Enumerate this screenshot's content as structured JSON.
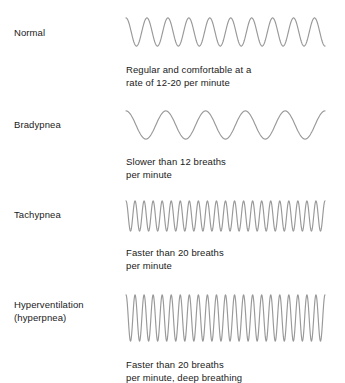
{
  "figure": {
    "background_color": "#ffffff",
    "text_color": "#1a1a1a",
    "wave_color": "#999999"
  },
  "chart_data": {
    "type": "line",
    "xlabel": "",
    "ylabel": "",
    "grid": false,
    "legend_position": "left-labels",
    "series": [
      {
        "name": "Normal",
        "cycles": 9.5,
        "amplitude_px": 30,
        "rate_description": "12-20 per minute",
        "wave_x_start_px": 126,
        "wave_x_end_px": 325,
        "wave_y_top_px": 17,
        "wave_y_bottom_px": 47
      },
      {
        "name": "Bradypnea",
        "cycles": 5,
        "amplitude_px": 30,
        "rate_description": "slower than 12 per minute",
        "wave_x_start_px": 126,
        "wave_x_end_px": 325,
        "wave_y_top_px": 110,
        "wave_y_bottom_px": 140
      },
      {
        "name": "Tachypnea",
        "cycles": 22,
        "amplitude_px": 32,
        "rate_description": "faster than 20 per minute",
        "wave_x_start_px": 126,
        "wave_x_end_px": 325,
        "wave_y_top_px": 200,
        "wave_y_bottom_px": 232
      },
      {
        "name": "Hyperventilation (hyperpnea)",
        "cycles": 22,
        "amplitude_px": 48,
        "rate_description": "faster than 20 per minute, deep breathing",
        "wave_x_start_px": 126,
        "wave_x_end_px": 325,
        "wave_y_top_px": 294,
        "wave_y_bottom_px": 342
      }
    ]
  },
  "rows": [
    {
      "label": "Normal",
      "description": "Regular and comfortable at a\nrate of 12-20 per minute",
      "label_top": 27,
      "wave_top": 17,
      "wave_height": 30,
      "desc_top": 64,
      "cycles": 9.5,
      "width": 199
    },
    {
      "label": "Bradypnea",
      "description": "Slower than 12 breaths\nper minute",
      "label_top": 119,
      "wave_top": 110,
      "wave_height": 30,
      "desc_top": 156,
      "cycles": 5,
      "width": 199
    },
    {
      "label": "Tachypnea",
      "description": "Faster than 20 breaths\nper minute",
      "label_top": 209,
      "wave_top": 200,
      "wave_height": 32,
      "desc_top": 247,
      "cycles": 22,
      "width": 199
    },
    {
      "label": "Hyperventilation\n(hyperpnea)",
      "description": "Faster than 20 breaths\nper minute, deep breathing",
      "label_top": 299,
      "wave_top": 294,
      "wave_height": 48,
      "desc_top": 359,
      "cycles": 22,
      "width": 199
    }
  ]
}
